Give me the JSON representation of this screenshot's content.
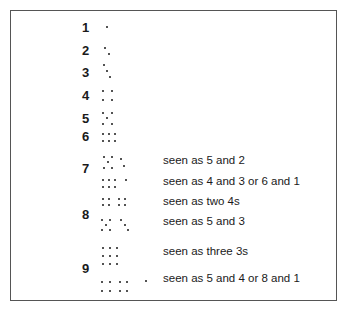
{
  "figure": {
    "rows": [
      {
        "label": "1",
        "label_pos": [
          82,
          21
        ]
      },
      {
        "label": "2",
        "label_pos": [
          82,
          44
        ]
      },
      {
        "label": "3",
        "label_pos": [
          82,
          66
        ]
      },
      {
        "label": "4",
        "label_pos": [
          82,
          89
        ]
      },
      {
        "label": "5",
        "label_pos": [
          82,
          112
        ]
      },
      {
        "label": "6",
        "label_pos": [
          82,
          130
        ]
      },
      {
        "label": "7",
        "label_pos": [
          82,
          162
        ]
      },
      {
        "label": "8",
        "label_pos": [
          82,
          208
        ]
      },
      {
        "label": "9",
        "label_pos": [
          82,
          262
        ]
      }
    ],
    "captions": [
      {
        "text": "seen as 5 and 2",
        "pos": [
          163,
          155
        ]
      },
      {
        "text": "seen as 4 and 3 or 6 and 1",
        "pos": [
          163,
          176
        ]
      },
      {
        "text": "seen as two 4s",
        "pos": [
          163,
          196
        ]
      },
      {
        "text": "seen as 5 and 3",
        "pos": [
          163,
          216
        ]
      },
      {
        "text": "seen as three 3s",
        "pos": [
          163,
          246
        ]
      },
      {
        "text": "seen as 5 and 4 or 8 and 1",
        "pos": [
          163,
          273
        ]
      }
    ],
    "dots": [
      [
        107,
        27
      ],
      [
        105,
        48
      ],
      [
        109,
        54
      ],
      [
        104,
        65
      ],
      [
        107,
        71
      ],
      [
        110,
        77
      ],
      [
        103,
        91
      ],
      [
        112,
        91
      ],
      [
        103,
        100
      ],
      [
        112,
        100
      ],
      [
        103,
        113
      ],
      [
        112,
        113
      ],
      [
        107,
        118
      ],
      [
        103,
        124
      ],
      [
        112,
        124
      ],
      [
        103,
        134
      ],
      [
        109,
        134
      ],
      [
        115,
        134
      ],
      [
        103,
        141
      ],
      [
        109,
        141
      ],
      [
        115,
        141
      ],
      [
        104,
        157
      ],
      [
        112,
        157
      ],
      [
        108,
        162
      ],
      [
        104,
        168
      ],
      [
        112,
        168
      ],
      [
        121,
        159
      ],
      [
        124,
        166
      ],
      [
        103,
        180
      ],
      [
        109,
        180
      ],
      [
        115,
        180
      ],
      [
        126,
        180
      ],
      [
        103,
        187
      ],
      [
        109,
        187
      ],
      [
        115,
        187
      ],
      [
        103,
        199
      ],
      [
        109,
        199
      ],
      [
        119,
        199
      ],
      [
        125,
        199
      ],
      [
        103,
        205
      ],
      [
        109,
        205
      ],
      [
        119,
        205
      ],
      [
        125,
        205
      ],
      [
        102,
        220
      ],
      [
        110,
        220
      ],
      [
        106,
        225
      ],
      [
        102,
        230
      ],
      [
        110,
        230
      ],
      [
        121,
        220
      ],
      [
        125,
        225
      ],
      [
        128,
        230
      ],
      [
        103,
        248
      ],
      [
        110,
        248
      ],
      [
        117,
        248
      ],
      [
        103,
        256
      ],
      [
        110,
        256
      ],
      [
        117,
        256
      ],
      [
        103,
        264
      ],
      [
        110,
        264
      ],
      [
        117,
        264
      ],
      [
        102,
        282
      ],
      [
        110,
        282
      ],
      [
        120,
        282
      ],
      [
        127,
        282
      ],
      [
        146,
        281
      ],
      [
        102,
        291
      ],
      [
        110,
        291
      ],
      [
        120,
        291
      ],
      [
        127,
        291
      ]
    ]
  }
}
